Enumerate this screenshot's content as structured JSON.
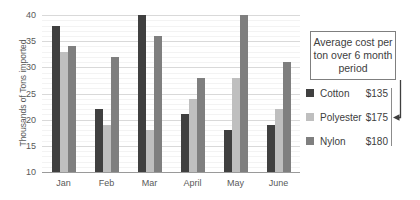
{
  "chart_data": {
    "type": "bar",
    "title": "",
    "xlabel": "",
    "ylabel": "Thousands of Tons imported",
    "categories": [
      "Jan",
      "Feb",
      "Mar",
      "April",
      "May",
      "June"
    ],
    "series": [
      {
        "name": "Cotton",
        "color": "#404040",
        "values": [
          38,
          22,
          40,
          21,
          18,
          19
        ]
      },
      {
        "name": "Polyester",
        "color": "#bfbfbf",
        "values": [
          33,
          19,
          18,
          24,
          28,
          22
        ]
      },
      {
        "name": "Nylon",
        "color": "#7f7f7f",
        "values": [
          34,
          32,
          36,
          28,
          40,
          31
        ]
      }
    ],
    "ylim": [
      10,
      40
    ],
    "yticks": [
      40,
      35,
      30,
      25,
      20,
      15,
      10
    ],
    "grid": "horizontal major every 5 with faint minor lines every 1",
    "legend_position": "right-outside"
  },
  "annotation_box": {
    "text": "Average cost per ton over 6 month period"
  },
  "legend": {
    "items": [
      {
        "name": "Cotton",
        "price": "$135",
        "color": "#404040"
      },
      {
        "name": "Polyester",
        "price": "$175",
        "color": "#bfbfbf"
      },
      {
        "name": "Nylon",
        "price": "$180",
        "color": "#7f7f7f"
      }
    ]
  },
  "colors": {
    "major_gridline": "#d9d9d9",
    "minor_gridline": "#f3f3f3",
    "axis_line": "#9a9a9a",
    "text": "#595959",
    "callout_border": "#7f7f7f",
    "arrow": "#3f3f3f"
  }
}
